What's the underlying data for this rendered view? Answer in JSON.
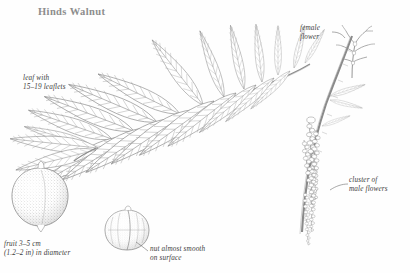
{
  "plate": {
    "title": "Hinds Walnut",
    "background_color": "#fefefe",
    "ink_color": "#7a7a7a",
    "title_color": "#8d8d8d",
    "label_color": "#3b3b3b",
    "width": 410,
    "height": 273
  },
  "labels": {
    "leaf": "leaf with\n15–19 leaflets",
    "fruit": "fruit 3–5 cm\n(1.2–2 in) in diameter",
    "nut": "nut almost smooth\non surface",
    "female_flower": "female\nflower",
    "male_flowers": "cluster of\nmale flowers"
  },
  "figures": {
    "compound_leaf": "pinnately-compound-leaf",
    "fruit": "round-stippled-fruit",
    "nut": "walnut-shell-with-seam",
    "female_flower": "female-flower-sprig",
    "male_catkins": "pendulous-male-catkin-cluster",
    "twig": "woody-twig"
  }
}
